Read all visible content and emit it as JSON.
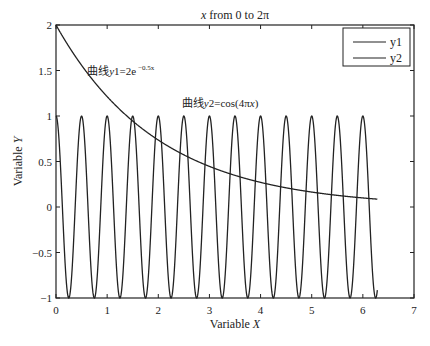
{
  "chart_data": {
    "type": "line",
    "title": "x from 0 to 2π",
    "title_parts": {
      "italic": "x",
      "rest": " from 0 to 2π"
    },
    "xlabel": "Variable X",
    "xlabel_parts": {
      "plain": "Variable ",
      "italic": "X"
    },
    "ylabel": "Variable Y",
    "ylabel_parts": {
      "plain": "Variable ",
      "italic": "Y"
    },
    "xlim": [
      0,
      7
    ],
    "ylim": [
      -1,
      2
    ],
    "xticks": [
      0,
      1,
      2,
      3,
      4,
      5,
      6,
      7
    ],
    "xtick_labels": [
      "0",
      "1",
      "2",
      "3",
      "4",
      "5",
      "6",
      "7"
    ],
    "yticks": [
      -1,
      -0.5,
      0,
      0.5,
      1,
      1.5,
      2
    ],
    "ytick_labels": [
      "−1",
      "−0.5",
      "0",
      "0.5",
      "1",
      "1.5",
      "2"
    ],
    "grid": false,
    "legend": {
      "position": "top-right",
      "entries": [
        "y1",
        "y2"
      ]
    },
    "series": [
      {
        "name": "y1",
        "formula": "2*exp(-0.5*x)",
        "x_range": [
          0,
          6.2832
        ],
        "sample_points": {
          "x": [
            0,
            0.5,
            1,
            1.5,
            2,
            2.5,
            3,
            3.5,
            4,
            4.5,
            5,
            5.5,
            6,
            6.2832
          ],
          "y": [
            2.0,
            1.558,
            1.213,
            0.945,
            0.736,
            0.573,
            0.446,
            0.348,
            0.271,
            0.211,
            0.164,
            0.128,
            0.1,
            0.086
          ]
        },
        "color": "#222222"
      },
      {
        "name": "y2",
        "formula": "cos(4*pi*x)",
        "x_range": [
          0,
          6.2832
        ],
        "sample_points": {
          "x": [
            0,
            0.25,
            0.5,
            0.75,
            1,
            1.25,
            1.5,
            1.75,
            2,
            2.25,
            2.5,
            2.75,
            3,
            3.25,
            3.5,
            3.75,
            4,
            4.25,
            4.5,
            4.75,
            5,
            5.25,
            5.5,
            5.75,
            6,
            6.25
          ],
          "y": [
            1,
            -1,
            1,
            -1,
            1,
            -1,
            1,
            -1,
            1,
            -1,
            1,
            -1,
            1,
            -1,
            1,
            -1,
            1,
            -1,
            1,
            -1,
            1,
            -1,
            1,
            -1,
            1,
            -1
          ]
        },
        "color": "#222222"
      }
    ],
    "annotations": [
      {
        "text": "曲线y1=2e^{-0.5x}",
        "prefix": "曲线",
        "italic": "y",
        "body": "1=2e",
        "sup": "−0.5x",
        "at": [
          1.0,
          1.45
        ]
      },
      {
        "text": "曲线y2=cos(4πx)",
        "prefix": "曲线",
        "italic": "y",
        "body": "2=cos(4π",
        "italic2": "x",
        "tail": ")",
        "at": [
          2.5,
          1.1
        ]
      }
    ]
  }
}
